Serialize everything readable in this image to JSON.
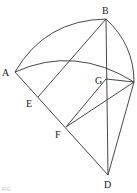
{
  "diagram": {
    "type": "geometric-construction",
    "points": {
      "A": {
        "x": 15,
        "y": 72
      },
      "B": {
        "x": 106,
        "y": 19
      },
      "C": {
        "x": 134,
        "y": 82
      },
      "D": {
        "x": 108,
        "y": 175
      },
      "E": {
        "x": 38,
        "y": 97
      },
      "F": {
        "x": 66,
        "y": 127
      },
      "G": {
        "x": 106,
        "y": 79
      }
    },
    "labels": {
      "A": "A",
      "B": "B",
      "D": "D",
      "E": "E",
      "F": "F",
      "G": "G"
    },
    "segments": [
      [
        "A",
        "D"
      ],
      [
        "B",
        "D"
      ],
      [
        "E",
        "B"
      ],
      [
        "C",
        "D"
      ],
      [
        "F",
        "G"
      ],
      [
        "F",
        "C"
      ],
      [
        "G",
        "C"
      ]
    ],
    "arcs": [
      {
        "from": "A",
        "to": "B",
        "name": "arc-AB"
      },
      {
        "from": "B",
        "to": "C",
        "name": "arc-BC"
      },
      {
        "from": "A",
        "to": "C",
        "name": "arc-AC"
      }
    ],
    "footer_text": "FIG."
  }
}
